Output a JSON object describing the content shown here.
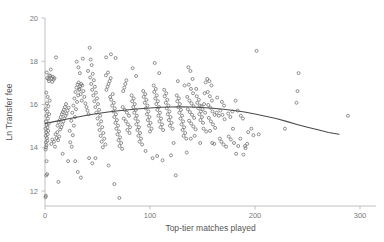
{
  "chart_data": {
    "type": "scatter",
    "title": "",
    "xlabel": "Top-tier matches played",
    "ylabel": "Ln Transfer fee",
    "xlim": [
      -8,
      310
    ],
    "ylim": [
      11.35,
      20.0
    ],
    "xticks": [
      0,
      100,
      200,
      300
    ],
    "yticks": [
      12,
      14,
      16,
      18,
      20
    ],
    "xtick_labels": [
      "0",
      "100",
      "200",
      "300"
    ],
    "ytick_labels": [
      "12",
      "14",
      "16",
      "18",
      "20"
    ],
    "grid": false,
    "legend": null,
    "marker": {
      "style": "open-circle",
      "size": 3.0,
      "edge_color": "#6d6d6d",
      "face_color": "none"
    },
    "fit": {
      "name": "quadratic-fit-line",
      "color": "#4a4a4a",
      "description": "Fitted quadratic curve rising gently from ~15.1 at x=0 to a peak of ~15.9 near x=130 then declining to ~14.6 at x=280",
      "x": [
        0,
        10,
        20,
        30,
        40,
        50,
        60,
        70,
        80,
        90,
        100,
        110,
        120,
        130,
        140,
        150,
        160,
        170,
        180,
        190,
        200,
        210,
        220,
        230,
        240,
        250,
        260,
        270,
        280
      ],
      "y": [
        15.12,
        15.22,
        15.32,
        15.41,
        15.5,
        15.58,
        15.65,
        15.71,
        15.76,
        15.8,
        15.84,
        15.87,
        15.885,
        15.89,
        15.88,
        15.86,
        15.83,
        15.78,
        15.72,
        15.65,
        15.56,
        15.46,
        15.35,
        15.22,
        15.08,
        14.95,
        14.83,
        14.71,
        14.62
      ]
    },
    "points": [
      [
        0.5,
        11.72
      ],
      [
        0.8,
        11.78
      ],
      [
        1.2,
        12.72
      ],
      [
        2.0,
        12.78
      ],
      [
        1.5,
        13.38
      ],
      [
        0.6,
        13.92
      ],
      [
        1.0,
        14.02
      ],
      [
        1.4,
        14.12
      ],
      [
        0.9,
        14.25
      ],
      [
        2.2,
        14.32
      ],
      [
        1.8,
        14.45
      ],
      [
        0.7,
        14.55
      ],
      [
        2.6,
        14.62
      ],
      [
        1.1,
        14.72
      ],
      [
        3.0,
        14.78
      ],
      [
        0.4,
        14.88
      ],
      [
        2.4,
        14.95
      ],
      [
        1.6,
        15.05
      ],
      [
        3.6,
        15.12
      ],
      [
        0.9,
        15.22
      ],
      [
        2.8,
        15.35
      ],
      [
        1.3,
        15.48
      ],
      [
        4.0,
        15.55
      ],
      [
        2.1,
        15.68
      ],
      [
        0.6,
        15.78
      ],
      [
        3.2,
        15.92
      ],
      [
        1.9,
        16.05
      ],
      [
        4.5,
        16.18
      ],
      [
        2.5,
        16.35
      ],
      [
        1.2,
        16.55
      ],
      [
        3.8,
        17.08
      ],
      [
        2.0,
        17.22
      ],
      [
        4.2,
        17.35
      ],
      [
        1.6,
        17.48
      ],
      [
        5.5,
        17.62
      ],
      [
        3.4,
        17.18
      ],
      [
        6.2,
        17.22
      ],
      [
        5.0,
        17.32
      ],
      [
        7.5,
        17.28
      ],
      [
        8.2,
        17.15
      ],
      [
        6.8,
        17.05
      ],
      [
        9.0,
        17.22
      ],
      [
        10.5,
        18.18
      ],
      [
        7.0,
        14.38
      ],
      [
        8.5,
        14.28
      ],
      [
        6.0,
        14.18
      ],
      [
        9.5,
        14.05
      ],
      [
        11.0,
        14.45
      ],
      [
        12.5,
        14.35
      ],
      [
        10.0,
        14.62
      ],
      [
        13.5,
        14.52
      ],
      [
        11.8,
        14.72
      ],
      [
        14.5,
        14.85
      ],
      [
        12.0,
        15.02
      ],
      [
        15.5,
        14.95
      ],
      [
        13.0,
        15.18
      ],
      [
        16.5,
        15.08
      ],
      [
        14.0,
        15.28
      ],
      [
        17.5,
        15.22
      ],
      [
        15.0,
        15.42
      ],
      [
        18.5,
        15.35
      ],
      [
        16.0,
        15.55
      ],
      [
        19.5,
        15.48
      ],
      [
        17.0,
        15.65
      ],
      [
        20.5,
        15.58
      ],
      [
        18.0,
        15.75
      ],
      [
        21.5,
        15.72
      ],
      [
        19.0,
        15.88
      ],
      [
        22.5,
        15.85
      ],
      [
        20.0,
        16.02
      ],
      [
        12.8,
        12.42
      ],
      [
        16.8,
        13.72
      ],
      [
        22.0,
        13.38
      ],
      [
        25.5,
        14.05
      ],
      [
        24.0,
        14.25
      ],
      [
        26.5,
        14.58
      ],
      [
        23.5,
        14.78
      ],
      [
        27.5,
        15.02
      ],
      [
        25.0,
        15.25
      ],
      [
        28.5,
        15.42
      ],
      [
        26.0,
        15.62
      ],
      [
        29.5,
        15.78
      ],
      [
        27.0,
        15.95
      ],
      [
        30.5,
        16.12
      ],
      [
        28.0,
        16.28
      ],
      [
        31.5,
        16.42
      ],
      [
        29.0,
        16.58
      ],
      [
        32.5,
        16.68
      ],
      [
        30.0,
        16.78
      ],
      [
        33.5,
        16.85
      ],
      [
        31.0,
        16.92
      ],
      [
        34.5,
        16.95
      ],
      [
        32.0,
        17.02
      ],
      [
        35.5,
        16.88
      ],
      [
        33.0,
        16.72
      ],
      [
        36.5,
        16.62
      ],
      [
        34.0,
        16.48
      ],
      [
        37.5,
        16.35
      ],
      [
        35.0,
        16.18
      ],
      [
        38.5,
        16.05
      ],
      [
        30.2,
        17.98
      ],
      [
        31.8,
        17.72
      ],
      [
        33.2,
        17.45
      ],
      [
        36.0,
        18.12
      ],
      [
        28.8,
        13.38
      ],
      [
        31.2,
        12.88
      ],
      [
        34.2,
        12.62
      ],
      [
        39.5,
        15.88
      ],
      [
        40.5,
        15.72
      ],
      [
        41.5,
        15.55
      ],
      [
        42.5,
        18.62
      ],
      [
        43.5,
        18.08
      ],
      [
        44.5,
        17.82
      ],
      [
        41.0,
        17.55
      ],
      [
        45.5,
        17.42
      ],
      [
        43.0,
        17.25
      ],
      [
        46.5,
        17.12
      ],
      [
        44.0,
        16.95
      ],
      [
        47.5,
        16.82
      ],
      [
        45.0,
        16.68
      ],
      [
        48.5,
        16.55
      ],
      [
        46.0,
        16.42
      ],
      [
        49.5,
        16.28
      ],
      [
        47.0,
        16.15
      ],
      [
        50.5,
        16.02
      ],
      [
        48.0,
        15.88
      ],
      [
        51.5,
        15.75
      ],
      [
        49.0,
        15.62
      ],
      [
        52.5,
        15.48
      ],
      [
        50.0,
        15.35
      ],
      [
        53.5,
        15.22
      ],
      [
        51.0,
        15.08
      ],
      [
        54.5,
        14.95
      ],
      [
        52.0,
        14.82
      ],
      [
        55.5,
        14.68
      ],
      [
        53.0,
        14.55
      ],
      [
        56.5,
        14.42
      ],
      [
        54.0,
        14.28
      ],
      [
        57.5,
        14.15
      ],
      [
        55.0,
        14.02
      ],
      [
        42.0,
        13.52
      ],
      [
        45.0,
        13.28
      ],
      [
        48.0,
        13.52
      ],
      [
        58.5,
        16.68
      ],
      [
        59.5,
        16.82
      ],
      [
        60.5,
        16.95
      ],
      [
        61.5,
        17.08
      ],
      [
        62.5,
        17.22
      ],
      [
        58.0,
        17.35
      ],
      [
        60.0,
        17.48
      ],
      [
        62.0,
        16.35
      ],
      [
        64.5,
        16.48
      ],
      [
        63.0,
        16.22
      ],
      [
        65.5,
        16.08
      ],
      [
        64.0,
        15.95
      ],
      [
        66.5,
        15.82
      ],
      [
        65.0,
        15.68
      ],
      [
        67.5,
        15.55
      ],
      [
        66.0,
        15.42
      ],
      [
        68.5,
        15.28
      ],
      [
        67.0,
        15.15
      ],
      [
        69.5,
        15.02
      ],
      [
        68.0,
        14.88
      ],
      [
        70.5,
        14.75
      ],
      [
        69.0,
        14.62
      ],
      [
        71.5,
        14.48
      ],
      [
        70.0,
        14.35
      ],
      [
        72.5,
        14.22
      ],
      [
        71.0,
        14.08
      ],
      [
        73.5,
        13.95
      ],
      [
        58.2,
        18.18
      ],
      [
        62.8,
        18.32
      ],
      [
        67.2,
        18.15
      ],
      [
        70.8,
        11.68
      ],
      [
        66.0,
        12.32
      ],
      [
        60.5,
        13.18
      ],
      [
        74.5,
        16.62
      ],
      [
        75.5,
        16.78
      ],
      [
        76.5,
        16.95
      ],
      [
        77.5,
        17.12
      ],
      [
        74.0,
        15.88
      ],
      [
        76.0,
        15.75
      ],
      [
        78.0,
        15.62
      ],
      [
        80.0,
        15.48
      ],
      [
        75.0,
        15.35
      ],
      [
        77.0,
        15.22
      ],
      [
        79.0,
        15.08
      ],
      [
        81.0,
        14.95
      ],
      [
        78.5,
        14.82
      ],
      [
        80.5,
        14.68
      ],
      [
        82.5,
        16.42
      ],
      [
        84.5,
        16.28
      ],
      [
        83.0,
        16.15
      ],
      [
        85.5,
        16.02
      ],
      [
        84.0,
        15.88
      ],
      [
        86.5,
        15.75
      ],
      [
        85.0,
        15.62
      ],
      [
        87.5,
        15.48
      ],
      [
        86.0,
        15.35
      ],
      [
        88.5,
        15.22
      ],
      [
        87.0,
        15.08
      ],
      [
        89.5,
        14.95
      ],
      [
        88.0,
        14.82
      ],
      [
        90.5,
        14.68
      ],
      [
        89.0,
        14.55
      ],
      [
        91.5,
        14.42
      ],
      [
        90.0,
        14.28
      ],
      [
        92.5,
        14.15
      ],
      [
        83.5,
        17.68
      ],
      [
        86.8,
        17.32
      ],
      [
        93.5,
        16.62
      ],
      [
        95.5,
        16.48
      ],
      [
        94.0,
        16.35
      ],
      [
        96.5,
        16.22
      ],
      [
        95.0,
        16.08
      ],
      [
        97.5,
        15.95
      ],
      [
        96.0,
        15.82
      ],
      [
        98.5,
        15.68
      ],
      [
        97.0,
        15.55
      ],
      [
        99.5,
        15.42
      ],
      [
        98.0,
        15.28
      ],
      [
        100.5,
        15.15
      ],
      [
        99.0,
        15.02
      ],
      [
        101.5,
        14.88
      ],
      [
        100.0,
        14.75
      ],
      [
        102.5,
        13.52
      ],
      [
        95.8,
        13.85
      ],
      [
        103.5,
        16.88
      ],
      [
        105.5,
        16.72
      ],
      [
        104.0,
        16.58
      ],
      [
        106.5,
        16.42
      ],
      [
        105.0,
        16.28
      ],
      [
        107.5,
        16.15
      ],
      [
        106.0,
        16.02
      ],
      [
        108.5,
        15.88
      ],
      [
        107.0,
        15.75
      ],
      [
        109.5,
        15.62
      ],
      [
        108.0,
        15.48
      ],
      [
        110.5,
        15.35
      ],
      [
        109.0,
        15.22
      ],
      [
        111.5,
        15.08
      ],
      [
        110.0,
        14.95
      ],
      [
        112.5,
        14.82
      ],
      [
        104.5,
        17.92
      ],
      [
        108.8,
        17.45
      ],
      [
        112.0,
        13.42
      ],
      [
        106.8,
        13.62
      ],
      [
        113.5,
        16.68
      ],
      [
        115.5,
        16.52
      ],
      [
        114.0,
        16.38
      ],
      [
        116.5,
        16.22
      ],
      [
        115.0,
        16.08
      ],
      [
        117.5,
        15.95
      ],
      [
        116.0,
        15.82
      ],
      [
        118.5,
        15.68
      ],
      [
        117.0,
        15.55
      ],
      [
        119.5,
        15.42
      ],
      [
        118.0,
        15.28
      ],
      [
        120.5,
        15.15
      ],
      [
        119.0,
        15.02
      ],
      [
        121.5,
        14.88
      ],
      [
        122.5,
        14.22
      ],
      [
        120.0,
        13.65
      ],
      [
        124.5,
        12.72
      ],
      [
        125.5,
        16.42
      ],
      [
        127.5,
        16.28
      ],
      [
        126.0,
        16.15
      ],
      [
        128.5,
        16.02
      ],
      [
        127.0,
        15.88
      ],
      [
        129.5,
        15.75
      ],
      [
        128.0,
        15.62
      ],
      [
        130.5,
        15.48
      ],
      [
        129.0,
        15.35
      ],
      [
        131.5,
        15.22
      ],
      [
        130.0,
        15.08
      ],
      [
        132.5,
        14.95
      ],
      [
        131.0,
        14.82
      ],
      [
        133.5,
        14.68
      ],
      [
        132.0,
        14.55
      ],
      [
        134.5,
        14.42
      ],
      [
        126.5,
        17.08
      ],
      [
        133.0,
        16.88
      ],
      [
        136.5,
        17.72
      ],
      [
        138.5,
        17.55
      ],
      [
        140.5,
        17.18
      ],
      [
        137.0,
        16.92
      ],
      [
        139.0,
        16.72
      ],
      [
        141.0,
        16.52
      ],
      [
        135.5,
        16.35
      ],
      [
        137.5,
        16.18
      ],
      [
        139.5,
        16.05
      ],
      [
        141.5,
        15.92
      ],
      [
        136.0,
        15.78
      ],
      [
        138.0,
        15.65
      ],
      [
        140.0,
        15.52
      ],
      [
        142.0,
        15.38
      ],
      [
        137.2,
        15.25
      ],
      [
        139.2,
        15.12
      ],
      [
        141.2,
        14.98
      ],
      [
        143.5,
        14.85
      ],
      [
        135.0,
        13.78
      ],
      [
        138.8,
        14.42
      ],
      [
        142.5,
        14.55
      ],
      [
        144.5,
        16.38
      ],
      [
        146.5,
        16.22
      ],
      [
        145.0,
        16.08
      ],
      [
        147.5,
        15.95
      ],
      [
        146.0,
        15.82
      ],
      [
        148.5,
        15.68
      ],
      [
        147.0,
        15.55
      ],
      [
        149.5,
        15.42
      ],
      [
        148.0,
        15.28
      ],
      [
        150.5,
        15.15
      ],
      [
        149.0,
        15.92
      ],
      [
        151.5,
        16.02
      ],
      [
        150.0,
        15.78
      ],
      [
        152.5,
        15.62
      ],
      [
        151.0,
        14.88
      ],
      [
        153.5,
        14.75
      ],
      [
        147.8,
        14.22
      ],
      [
        154.5,
        17.18
      ],
      [
        156.5,
        17.08
      ],
      [
        158.5,
        16.88
      ],
      [
        155.0,
        16.58
      ],
      [
        157.0,
        16.38
      ],
      [
        159.0,
        16.18
      ],
      [
        155.5,
        15.98
      ],
      [
        157.5,
        15.85
      ],
      [
        159.5,
        15.68
      ],
      [
        161.5,
        15.52
      ],
      [
        156.0,
        15.38
      ],
      [
        158.0,
        15.22
      ],
      [
        160.0,
        15.08
      ],
      [
        162.0,
        14.92
      ],
      [
        157.2,
        14.78
      ],
      [
        159.2,
        14.22
      ],
      [
        161.2,
        14.18
      ],
      [
        163.5,
        15.62
      ],
      [
        165.5,
        15.48
      ],
      [
        164.0,
        16.32
      ],
      [
        168.5,
        16.12
      ],
      [
        170.5,
        15.95
      ],
      [
        167.0,
        15.72
      ],
      [
        169.0,
        15.52
      ],
      [
        171.0,
        15.32
      ],
      [
        166.5,
        14.42
      ],
      [
        168.0,
        14.28
      ],
      [
        170.0,
        14.15
      ],
      [
        172.5,
        14.05
      ],
      [
        174.5,
        15.58
      ],
      [
        176.5,
        15.42
      ],
      [
        178.5,
        15.68
      ],
      [
        175.0,
        14.52
      ],
      [
        177.0,
        14.38
      ],
      [
        179.0,
        14.88
      ],
      [
        181.5,
        16.18
      ],
      [
        183.5,
        15.72
      ],
      [
        180.0,
        14.22
      ],
      [
        182.0,
        13.72
      ],
      [
        184.0,
        14.08
      ],
      [
        186.5,
        15.48
      ],
      [
        188.5,
        15.35
      ],
      [
        190.5,
        14.08
      ],
      [
        192.5,
        14.18
      ],
      [
        191.0,
        13.98
      ],
      [
        193.5,
        14.72
      ],
      [
        196.5,
        14.88
      ],
      [
        198.5,
        14.58
      ],
      [
        201.5,
        18.48
      ],
      [
        203.5,
        14.62
      ],
      [
        228.5,
        14.88
      ],
      [
        239.5,
        16.08
      ],
      [
        240.5,
        16.62
      ],
      [
        241.5,
        17.45
      ],
      [
        288.5,
        15.48
      ],
      [
        189.0,
        13.68
      ],
      [
        186.0,
        14.42
      ],
      [
        152.0,
        16.52
      ],
      [
        144.0,
        16.72
      ],
      [
        153.0,
        17.02
      ]
    ]
  }
}
